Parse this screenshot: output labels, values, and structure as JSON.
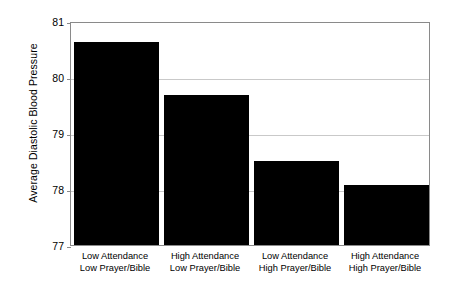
{
  "chart_data": {
    "type": "bar",
    "title": "",
    "xlabel": "",
    "ylabel": "Average Diastolic Blood Pressure",
    "ylim": [
      77,
      81
    ],
    "yticks": [
      77,
      78,
      79,
      80,
      81
    ],
    "ytick_labels": [
      "77",
      "78",
      "79",
      "80",
      "81"
    ],
    "grid": true,
    "legend": "none",
    "bar_color": "#000000",
    "categories": [
      "Low Attendance Low Prayer/Bible",
      "High Attendance Low Prayer/Bible",
      "Low Attendance High Prayer/Bible",
      "High Attendance High Prayer/Bible"
    ],
    "category_lines": [
      [
        "Low Attendance",
        "Low Prayer/Bible"
      ],
      [
        "High Attendance",
        "Low Prayer/Bible"
      ],
      [
        "Low Attendance",
        "High Prayer/Bible"
      ],
      [
        "High Attendance",
        "High Prayer/Bible"
      ]
    ],
    "values": [
      80.63,
      79.68,
      78.5,
      78.07
    ]
  },
  "colors": {
    "bar": "#000000",
    "grid": "#c9c9c9",
    "frame": "#8a8a8a",
    "background": "#ffffff",
    "text": "#000000"
  }
}
